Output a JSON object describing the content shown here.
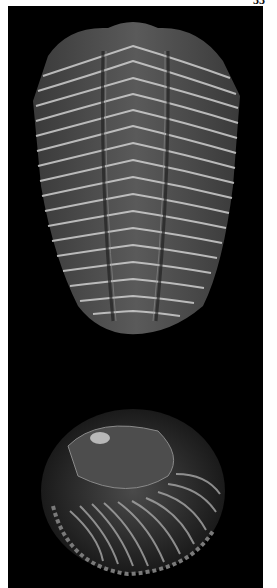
{
  "page": {
    "page_number": "33",
    "background": "#ffffff"
  },
  "plate": {
    "background": "#000000",
    "figures": [
      {
        "name": "trilobite-dorsal-view",
        "description": "Trilobite fossil, dorsal view of thorax and pygidium"
      },
      {
        "name": "trilobite-enrolled",
        "description": "Enrolled trilobite fossil"
      }
    ]
  }
}
